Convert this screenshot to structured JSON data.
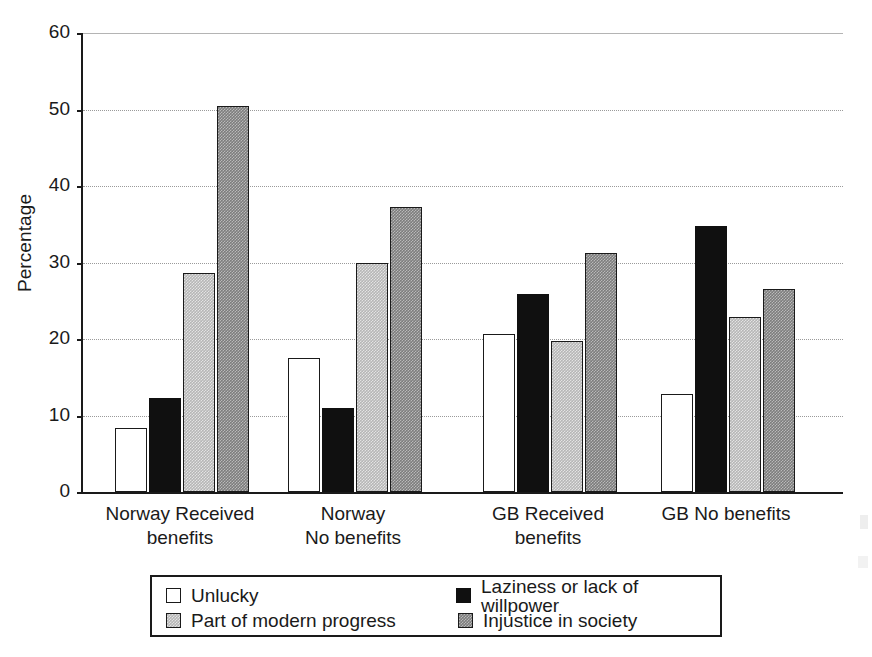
{
  "chart_data": {
    "type": "bar",
    "title": "",
    "xlabel": "",
    "ylabel": "Percentage",
    "ylim": [
      0,
      60
    ],
    "yticks": [
      0,
      10,
      20,
      30,
      40,
      50,
      60
    ],
    "ytick_labels": [
      "0",
      "10",
      "20",
      "30",
      "40",
      "50",
      "60"
    ],
    "grid": true,
    "legend_position": "bottom",
    "categories": [
      "Norway  Received\nbenefits",
      "Norway\nNo benefits",
      "GB  Received\nbenefits",
      "GB No benefits"
    ],
    "series": [
      {
        "name": "Unlucky",
        "color": "#ffffff",
        "fill": "white",
        "values": [
          8.4,
          17.5,
          20.6,
          12.8
        ]
      },
      {
        "name": "Laziness or lack of willpower",
        "color": "#101010",
        "fill": "black",
        "values": [
          12.3,
          11.0,
          25.9,
          34.8
        ]
      },
      {
        "name": "Part of modern progress",
        "color": "#b6b6b6",
        "fill": "light-gray-hatch",
        "values": [
          28.6,
          30.0,
          19.8,
          22.9
        ]
      },
      {
        "name": "Injustice in society",
        "color": "#7d7d7d",
        "fill": "dark-gray-hatch",
        "values": [
          50.5,
          37.3,
          31.3,
          26.5
        ]
      }
    ]
  },
  "legend": {
    "entries": [
      "Unlucky",
      "Laziness or lack of willpower",
      "Part of modern progress",
      "Injustice in society"
    ]
  }
}
